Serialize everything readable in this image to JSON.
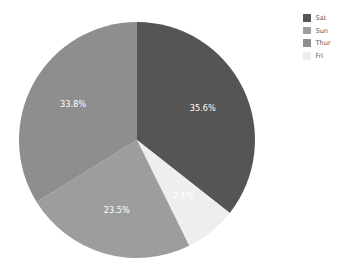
{
  "chart_data": {
    "type": "pie",
    "title": "",
    "subtitle": "",
    "xlabel": "",
    "ylabel": "",
    "grid": false,
    "legend_position": "right",
    "start_angle_deg": 90,
    "direction": "clockwise",
    "categories": [
      "Sat",
      "Sun",
      "Thur",
      "Fri"
    ],
    "values": [
      35.6,
      23.5,
      33.8,
      7.1
    ],
    "value_unit": "%",
    "slices": [
      {
        "label": "Sat",
        "value": 35.6,
        "data_label": "35.6%",
        "color": "#555555"
      },
      {
        "label": "Sun",
        "value": 23.5,
        "data_label": "23.5%",
        "color": "#9d9d9d"
      },
      {
        "label": "Thur",
        "value": 33.8,
        "data_label": "33.8%",
        "color": "#8e8e8e"
      },
      {
        "label": "Fri",
        "value": 7.1,
        "data_label": "7.1%",
        "color": "#eeeeee"
      }
    ],
    "draw_order": [
      {
        "label": "Sat",
        "data_label": "35.6%",
        "color": "#555555"
      },
      {
        "label": "Fri",
        "data_label": "7.1%",
        "color": "#eeeeee"
      },
      {
        "label": "Sun",
        "data_label": "23.5%",
        "color": "#9d9d9d"
      },
      {
        "label": "Thur",
        "data_label": "33.8%",
        "color": "#8e8e8e"
      }
    ],
    "label_color": "#ffffff",
    "background": "#ffffff"
  },
  "legend": {
    "items": [
      {
        "label": "Sat",
        "color": "#555555"
      },
      {
        "label": "Sun",
        "color": "#9d9d9d"
      },
      {
        "label": "Thur",
        "color": "#8e8e8e"
      },
      {
        "label": "Fri",
        "color": "#eeeeee"
      }
    ]
  },
  "geometry": {
    "center_x": 137,
    "center_y": 140,
    "radius": 118,
    "label_radius_factor": 0.62
  }
}
